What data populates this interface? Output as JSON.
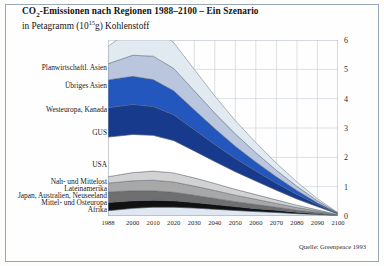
{
  "figure": {
    "title_main": "CO",
    "title_sub": "2",
    "title_rest": "-Emissionen nach Regionen 1988–2100 – Ein Szenario",
    "subtitle_pre": "in Petagramm (10",
    "subtitle_sup": "15",
    "subtitle_post": "g) Kohlenstoff",
    "source": "Quelle: Greenpeace 1993",
    "border_color": "#9aa7b4",
    "background": "#fefefe"
  },
  "chart_data": {
    "type": "area",
    "stacked": true,
    "subtitle": "in Petagramm (10^15 g) Kohlenstoff",
    "xlabel": "",
    "ylabel": "Petagramm (10^15 g) Kohlenstoff",
    "xlim": [
      1988,
      2100
    ],
    "ylim": [
      0,
      6
    ],
    "yticks": [
      0,
      1,
      2,
      3,
      4,
      5,
      6
    ],
    "ytick_labels": [
      "0",
      "1",
      "2",
      "3",
      "4",
      "5",
      "6"
    ],
    "y_axis_position": "right",
    "xticks": [
      1988,
      2000,
      2010,
      2020,
      2030,
      2040,
      2050,
      2060,
      2070,
      2080,
      2090,
      2100
    ],
    "xtick_labels": [
      "1988",
      "2000",
      "2010",
      "2020",
      "2030",
      "2040",
      "2050",
      "2060",
      "2070",
      "2080",
      "2090",
      "2100"
    ],
    "grid": true,
    "grid_color": "#c6ccd4",
    "legend_position": "left-inline-labels",
    "x": [
      1988,
      2000,
      2010,
      2020,
      2030,
      2040,
      2050,
      2060,
      2070,
      2080,
      2090,
      2100
    ],
    "series": [
      {
        "name": "Afrika",
        "color": "#dfe8f2",
        "order_from_bottom": 1,
        "label_y_px": 210,
        "values": [
          0.18,
          0.26,
          0.3,
          0.3,
          0.27,
          0.23,
          0.19,
          0.15,
          0.12,
          0.08,
          0.05,
          0.01
        ]
      },
      {
        "name": "Mittel- und Osteuropa",
        "color": "#111111",
        "order_from_bottom": 2,
        "label_y_px": 203,
        "values": [
          0.28,
          0.26,
          0.24,
          0.22,
          0.19,
          0.16,
          0.13,
          0.1,
          0.08,
          0.05,
          0.03,
          0.01
        ]
      },
      {
        "name": "Japan, Australien, Neuseeland",
        "color": "#6f6f6f",
        "order_from_bottom": 3,
        "label_y_px": 196,
        "values": [
          0.36,
          0.34,
          0.32,
          0.29,
          0.25,
          0.21,
          0.17,
          0.14,
          0.1,
          0.07,
          0.04,
          0.01
        ]
      },
      {
        "name": "Lateinamerika",
        "color": "#a8a8a8",
        "order_from_bottom": 4,
        "label_y_px": 189,
        "values": [
          0.3,
          0.34,
          0.36,
          0.35,
          0.31,
          0.27,
          0.22,
          0.18,
          0.13,
          0.09,
          0.05,
          0.01
        ]
      },
      {
        "name": "Nah- und Mittelost",
        "color": "#d2d2d2",
        "order_from_bottom": 5,
        "label_y_px": 182,
        "values": [
          0.22,
          0.28,
          0.31,
          0.31,
          0.28,
          0.24,
          0.2,
          0.16,
          0.12,
          0.08,
          0.04,
          0.01
        ]
      },
      {
        "name": "USA",
        "color": "#ffffff",
        "order_from_bottom": 6,
        "label_y_px": 165,
        "values": [
          1.35,
          1.3,
          1.22,
          1.1,
          0.92,
          0.75,
          0.6,
          0.46,
          0.33,
          0.21,
          0.11,
          0.02
        ]
      },
      {
        "name": "GUS",
        "color": "#173a8c",
        "order_from_bottom": 7,
        "label_y_px": 133,
        "values": [
          1.0,
          1.02,
          0.98,
          0.88,
          0.72,
          0.58,
          0.45,
          0.34,
          0.24,
          0.15,
          0.07,
          0.01
        ]
      },
      {
        "name": "Westeuropa, Kanada",
        "color": "#2457bd",
        "order_from_bottom": 8,
        "label_y_px": 110,
        "values": [
          0.95,
          0.96,
          0.92,
          0.82,
          0.68,
          0.54,
          0.42,
          0.31,
          0.22,
          0.14,
          0.06,
          0.01
        ]
      },
      {
        "name": "Übriges Asien",
        "color": "#b9c6dd",
        "order_from_bottom": 9,
        "label_y_px": 86,
        "values": [
          0.55,
          0.72,
          0.8,
          0.76,
          0.65,
          0.53,
          0.42,
          0.32,
          0.22,
          0.14,
          0.07,
          0.01
        ]
      },
      {
        "name": "Planwirtschaftl. Asien",
        "color": "#e2eaf1",
        "order_from_bottom": 10,
        "label_y_px": 68,
        "values": [
          0.6,
          0.88,
          0.95,
          0.88,
          0.73,
          0.58,
          0.45,
          0.34,
          0.24,
          0.15,
          0.07,
          0.01
        ]
      }
    ],
    "totals": [
      5.79,
      6.36,
      6.4,
      5.91,
      5.0,
      4.09,
      3.25,
      2.5,
      1.8,
      1.16,
      0.59,
      0.11
    ]
  }
}
